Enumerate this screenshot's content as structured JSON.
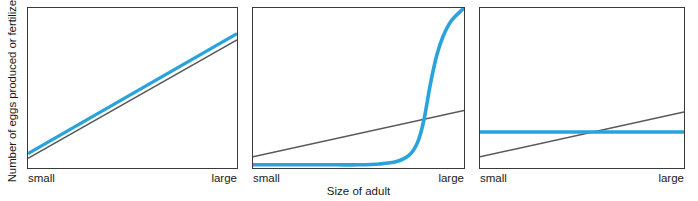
{
  "figure": {
    "axis_titles": {
      "y": "Number of eggs produced or fertilized",
      "x": "Size of adult"
    },
    "tick_labels": {
      "small": "small",
      "large": "large"
    },
    "colors": {
      "series_blue": "#29a3dc",
      "reference_gray": "#58585a",
      "frame": "#3a3a3a",
      "text": "#1a1a1a",
      "background": "#ffffff"
    }
  },
  "chart_data": [
    {
      "type": "line",
      "panel": 1,
      "title": "",
      "xlabel": "Size of adult",
      "ylabel": "Number of eggs produced or fertilized",
      "xlim": [
        0,
        1
      ],
      "ylim": [
        0,
        1
      ],
      "xticks": [
        0,
        1
      ],
      "xticklabels": [
        "small",
        "large"
      ],
      "yticks": [],
      "yticklabels": [],
      "grid": false,
      "legend": "none",
      "annotation": "Blue relationship rises linearly and nearly parallel to (slightly above) the gray reference line: output increases in direct proportion to adult size.",
      "series": [
        {
          "name": "reference",
          "color": "#58585a",
          "style": "solid-thin",
          "x": [
            0.0,
            1.0
          ],
          "y": [
            0.06,
            0.8
          ]
        },
        {
          "name": "observed",
          "color": "#29a3dc",
          "style": "solid-thick",
          "x": [
            0.0,
            1.0
          ],
          "y": [
            0.09,
            0.84
          ]
        }
      ]
    },
    {
      "type": "line",
      "panel": 2,
      "title": "",
      "xlabel": "Size of adult",
      "ylabel": "Number of eggs produced or fertilized",
      "xlim": [
        0,
        1
      ],
      "ylim": [
        0,
        1
      ],
      "xticks": [
        0,
        1
      ],
      "xticklabels": [
        "small",
        "large"
      ],
      "yticks": [],
      "yticklabels": [],
      "grid": false,
      "legend": "none",
      "annotation": "Blue relationship is flat and near zero until adults become large, then rises steeply (sigmoid/exponential threshold) far above the gray linear reference line.",
      "series": [
        {
          "name": "reference",
          "color": "#58585a",
          "style": "solid-thin",
          "x": [
            0.0,
            1.0
          ],
          "y": [
            0.07,
            0.36
          ]
        },
        {
          "name": "observed",
          "color": "#29a3dc",
          "style": "solid-thick",
          "x": [
            0.0,
            0.1,
            0.2,
            0.3,
            0.4,
            0.5,
            0.6,
            0.68,
            0.74,
            0.78,
            0.81,
            0.84,
            0.87,
            0.9,
            0.94,
            1.0
          ],
          "y": [
            0.02,
            0.02,
            0.02,
            0.02,
            0.02,
            0.02,
            0.025,
            0.04,
            0.08,
            0.16,
            0.3,
            0.52,
            0.7,
            0.82,
            0.92,
            1.0
          ]
        }
      ]
    },
    {
      "type": "line",
      "panel": 3,
      "title": "",
      "xlabel": "Size of adult",
      "ylabel": "Number of eggs produced or fertilized",
      "xlim": [
        0,
        1
      ],
      "ylim": [
        0,
        1
      ],
      "xticks": [
        0,
        1
      ],
      "xticklabels": [
        "small",
        "large"
      ],
      "yticks": [],
      "yticklabels": [],
      "grid": false,
      "legend": "none",
      "annotation": "Blue relationship is constant (horizontal) regardless of adult size; it crosses the rising gray reference line near mid-range.",
      "series": [
        {
          "name": "reference",
          "color": "#58585a",
          "style": "solid-thin",
          "x": [
            0.0,
            1.0
          ],
          "y": [
            0.07,
            0.35
          ]
        },
        {
          "name": "observed",
          "color": "#29a3dc",
          "style": "solid-thick",
          "x": [
            0.0,
            1.0
          ],
          "y": [
            0.225,
            0.225
          ]
        }
      ]
    }
  ]
}
